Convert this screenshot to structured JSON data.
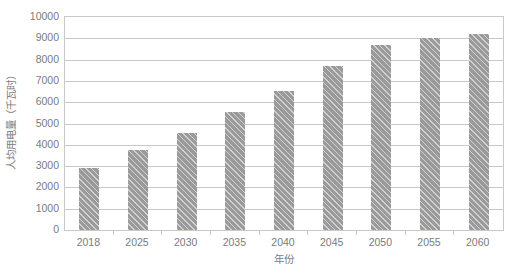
{
  "chart_data": {
    "type": "bar",
    "title": "",
    "subtitle": "",
    "xlabel": "年份",
    "ylabel": "人均用电量（千瓦时）",
    "categories": [
      "2018",
      "2025",
      "2030",
      "2035",
      "2040",
      "2045",
      "2050",
      "2055",
      "2060"
    ],
    "values": [
      2900,
      3770,
      4560,
      5520,
      6530,
      7700,
      8680,
      9000,
      9180
    ],
    "series": [
      {
        "name": "人均用电量",
        "values": [
          2900,
          3770,
          4560,
          5520,
          6530,
          7700,
          8680,
          9000,
          9180
        ]
      }
    ],
    "ylim": [
      0,
      10000
    ],
    "ytick_labels": [
      "0",
      "1000",
      "2000",
      "3000",
      "4000",
      "5000",
      "6000",
      "7000",
      "8000",
      "9000",
      "10000"
    ],
    "ytick_values": [
      0,
      1000,
      2000,
      3000,
      4000,
      5000,
      6000,
      7000,
      8000,
      9000,
      10000
    ],
    "grid": true,
    "grid_axis": "y",
    "legend": false,
    "legend_position": "none",
    "bar_color": "#9a9a9a",
    "bar_pattern": "diagonal-hatch",
    "grid_color": "#c9c9c9",
    "text_color": "#7b7b7b",
    "plot_background": "#ffffff"
  }
}
